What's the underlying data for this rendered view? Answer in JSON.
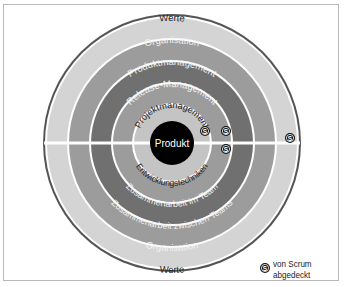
{
  "diagram": {
    "center_label": "Produkt",
    "top_rings": [
      {
        "label": "Werte",
        "color": "#d4d4d4",
        "text_color": "#222222"
      },
      {
        "label": "Organisation",
        "color": "#9c9c9c",
        "text_color": "#f2f2f2"
      },
      {
        "label": "Produktmanagement",
        "color": "#707070",
        "text_color": "#f2f2f2"
      },
      {
        "label": "Release-Management",
        "color": "#9c9c9c",
        "text_color": "#f2f2f2"
      },
      {
        "label": "Projektmanagement",
        "color": "#c4c4c4",
        "text_color": "#222222"
      }
    ],
    "bottom_rings": [
      {
        "label": "Werte",
        "color": "#d4d4d4",
        "text_color": "#222222"
      },
      {
        "label": "Organisation",
        "color": "#9c9c9c",
        "text_color": "#f2f2f2"
      },
      {
        "label": "Zusammenarbeit zwischen Teams",
        "color": "#707070",
        "text_color": "#f2f2f2"
      },
      {
        "label": "Zusammenarbeit im Team",
        "color": "#9c9c9c",
        "text_color": "#f2f2f2"
      },
      {
        "label": "Entwicklungstechniken",
        "color": "#c4c4c4",
        "text_color": "#222222"
      }
    ],
    "scrum_badges": [
      {
        "ring": "Projektmanagement",
        "glyph": "S"
      },
      {
        "ring": "Release-Management",
        "glyph": "S"
      },
      {
        "ring": "Zusammenarbeit im Team",
        "glyph": "S"
      },
      {
        "ring": "Werte",
        "glyph": "S"
      }
    ],
    "outline_color": "#555555",
    "center_color": "#000000"
  },
  "legend": {
    "glyph": "S",
    "line1": "von Scrum",
    "line2": "abgedeckt"
  }
}
